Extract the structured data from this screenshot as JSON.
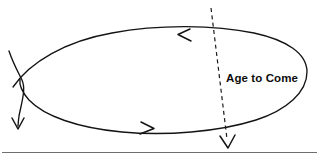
{
  "diagram": {
    "background_color": "#ffffff",
    "line_color": "#141414",
    "dashed_line_color": "#1a1a1a",
    "rule_color": "#6f6f6f",
    "labels": {
      "age_to_come": "Age to Come"
    },
    "elements": [
      {
        "name": "loop-curve",
        "kind": "open-ellipse-loop"
      },
      {
        "name": "loop-arrow-top",
        "kind": "arrowhead",
        "direction": "left"
      },
      {
        "name": "loop-arrow-bottom",
        "kind": "arrowhead",
        "direction": "right"
      },
      {
        "name": "exit-curve",
        "kind": "curved-stroke"
      },
      {
        "name": "exit-arrow",
        "kind": "arrowhead",
        "direction": "down"
      },
      {
        "name": "dashed-divider",
        "kind": "dashed-line"
      },
      {
        "name": "dashed-arrow",
        "kind": "arrowhead",
        "direction": "down"
      },
      {
        "name": "baseline-rule",
        "kind": "horizontal-rule"
      }
    ]
  }
}
